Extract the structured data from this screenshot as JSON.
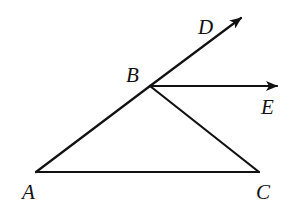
{
  "diagram": {
    "type": "geometry",
    "points": {
      "A": {
        "label": "A",
        "x": 36,
        "y": 172,
        "lx": 22,
        "ly": 199
      },
      "B": {
        "label": "B",
        "x": 150,
        "y": 86,
        "lx": 126,
        "ly": 82
      },
      "C": {
        "label": "C",
        "x": 259,
        "y": 172,
        "lx": 256,
        "ly": 199
      },
      "D": {
        "label": "D",
        "x": 241,
        "y": 18,
        "lx": 198,
        "ly": 34
      },
      "E": {
        "label": "E",
        "x": 277,
        "y": 86,
        "lx": 261,
        "ly": 114
      }
    },
    "segments": [
      {
        "name": "segment-AB",
        "from": "A",
        "to": "B"
      },
      {
        "name": "segment-BC",
        "from": "B",
        "to": "C"
      },
      {
        "name": "segment-AC",
        "from": "A",
        "to": "C"
      }
    ],
    "rays": [
      {
        "name": "ray-BD",
        "from": "B",
        "to": "D",
        "arrow": true
      },
      {
        "name": "ray-BE",
        "from": "B",
        "to": "E",
        "arrow": true
      }
    ],
    "colors": {
      "stroke": "#111111",
      "background": "#ffffff"
    }
  }
}
